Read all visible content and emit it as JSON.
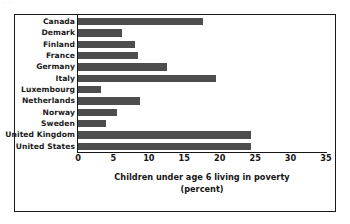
{
  "artifact_text": "· ··",
  "chart_data": {
    "type": "bar",
    "orientation": "horizontal",
    "title": "",
    "subtitle": "",
    "xlabel": "Children under age 6 living in poverty",
    "xlabel_line2": "(percent)",
    "ylabel": "",
    "xlim": [
      0,
      35
    ],
    "xticks": [
      0,
      5,
      10,
      15,
      20,
      25,
      30,
      35
    ],
    "xtick_labels": [
      "0",
      "5",
      "10",
      "15",
      "20",
      "25",
      "30",
      "35"
    ],
    "grid": false,
    "legend": null,
    "bar_color": "#4d4d4d",
    "categories": [
      "Canada",
      "Demark",
      "Finland",
      "France",
      "Germany",
      "Italy",
      "Luxembourg",
      "Netherlands",
      "Norway",
      "Sweden",
      "United Kingdom",
      "United States"
    ],
    "values": [
      17.7,
      6.2,
      8.0,
      8.5,
      12.6,
      19.5,
      3.3,
      8.8,
      5.5,
      4.0,
      25.0,
      26.1
    ]
  }
}
